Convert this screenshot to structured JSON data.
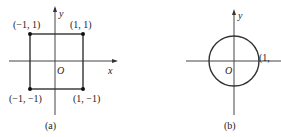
{
  "figures": [
    {
      "id": "a",
      "caption": "(a)",
      "axes": {
        "x_label": "x",
        "y_label": "y",
        "origin_label": "O"
      },
      "shape": "square",
      "points": [
        {
          "label": "(−1, 1)",
          "x": -1,
          "y": 1
        },
        {
          "label": "(1, 1)",
          "x": 1,
          "y": 1
        },
        {
          "label": "(−1, −1)",
          "x": -1,
          "y": -1
        },
        {
          "label": "(1, −1)",
          "x": 1,
          "y": -1
        }
      ]
    },
    {
      "id": "b",
      "caption": "(b)",
      "axes": {
        "y_label": "y",
        "origin_label": "O"
      },
      "shape": "circle",
      "radius": 1,
      "point_label": "(1, 0)",
      "point_label_visible": "(1, "
    }
  ]
}
